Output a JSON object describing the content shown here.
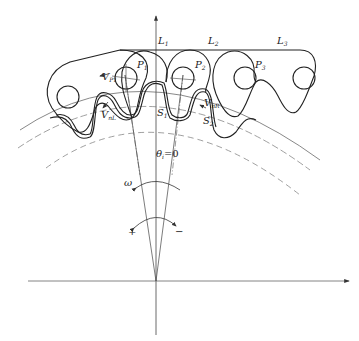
{
  "figure": {
    "colors": {
      "stroke": "#222222",
      "axis": "#555555",
      "dashed": "#777777",
      "background": "#ffffff"
    }
  },
  "labels": {
    "L1": {
      "base": "L",
      "sub": "1"
    },
    "L2": {
      "base": "L",
      "sub": "2"
    },
    "L3": {
      "base": "L",
      "sub": "3"
    },
    "P1": {
      "base": "P",
      "sub": "1"
    },
    "P2": {
      "base": "P",
      "sub": "2"
    },
    "P3": {
      "base": "P",
      "sub": "3"
    },
    "VP1": {
      "base": "V",
      "sub": "P1"
    },
    "VnL": {
      "base": "V",
      "sub": "nL"
    },
    "VnR": {
      "base": "V",
      "sub": "nR"
    },
    "S1": {
      "base": "S",
      "sub": "1"
    },
    "S2": {
      "base": "S",
      "sub": "2"
    },
    "theta": {
      "base": "θ",
      "sub": "i",
      "suffix": "=0"
    },
    "omega": "ω",
    "plus": "+",
    "minus": "−"
  }
}
